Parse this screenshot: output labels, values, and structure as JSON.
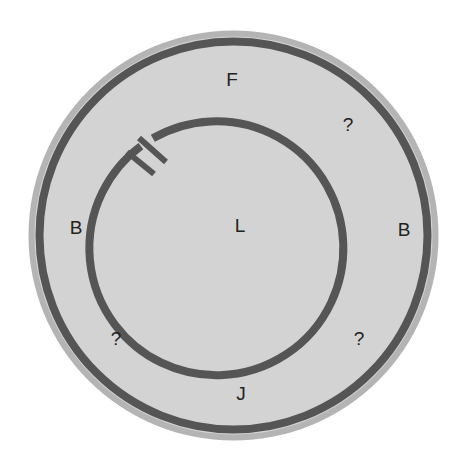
{
  "diagram": {
    "canvas": {
      "width": 466,
      "height": 469,
      "background": "#ffffff"
    },
    "outer_disc": {
      "center": [
        233.5,
        235.5
      ],
      "radius": 205,
      "rim_color": "#b4b4b4",
      "fill_color": "#d3d3d3",
      "ring_radius": 194,
      "ring_width": 8,
      "ring_color": "#555555"
    },
    "inner_ring": {
      "center": [
        234,
        232.5
      ],
      "radius": 127,
      "width": 8,
      "color": "#555555",
      "gap": {
        "angle_deg": 225,
        "span_deg": 6,
        "marker": "double-tick"
      }
    },
    "labels": {
      "top": "F",
      "top_right": "?",
      "left": "B",
      "right": "B",
      "center": "L",
      "bottom_left": "?",
      "bottom_right": "?",
      "bottom": "J"
    }
  }
}
